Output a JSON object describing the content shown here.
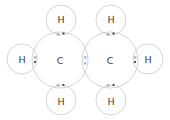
{
  "diagram": {
    "colors": {
      "shell": "#c8c8c8",
      "text": "#3a3a3a",
      "electron": "#333333"
    },
    "atoms": [
      {
        "id": "C1",
        "label": "C",
        "cx": 60,
        "cy": 60,
        "r": 28
      },
      {
        "id": "C2",
        "label": "C",
        "cx": 110,
        "cy": 60,
        "r": 28
      },
      {
        "id": "H1",
        "label": "H",
        "cx": 61,
        "cy": 20,
        "r": 15
      },
      {
        "id": "H2",
        "label": "H",
        "cx": 111,
        "cy": 20,
        "r": 15
      },
      {
        "id": "H3",
        "label": "H",
        "cx": 22,
        "cy": 59,
        "r": 15
      },
      {
        "id": "H4",
        "label": "H",
        "cx": 148,
        "cy": 59,
        "r": 15
      },
      {
        "id": "H5",
        "label": "H",
        "cx": 61,
        "cy": 100,
        "r": 15
      },
      {
        "id": "H6",
        "label": "H",
        "cx": 111,
        "cy": 100,
        "r": 15
      }
    ],
    "bonds": [
      {
        "between": [
          "C1",
          "H1"
        ],
        "electrons": [
          "cross",
          "dot"
        ]
      },
      {
        "between": [
          "C2",
          "H2"
        ],
        "electrons": [
          "cross",
          "dot"
        ]
      },
      {
        "between": [
          "C1",
          "H3"
        ],
        "electrons": [
          "cross",
          "dot"
        ]
      },
      {
        "between": [
          "C2",
          "H4"
        ],
        "electrons": [
          "cross",
          "dot"
        ]
      },
      {
        "between": [
          "C1",
          "H5"
        ],
        "electrons": [
          "cross",
          "dot"
        ]
      },
      {
        "between": [
          "C2",
          "H6"
        ],
        "electrons": [
          "cross",
          "dot"
        ]
      },
      {
        "between": [
          "C1",
          "C2"
        ],
        "electrons": [
          "cross",
          "cross"
        ]
      }
    ],
    "symbols": {
      "cross": "×",
      "dot": "•"
    }
  }
}
